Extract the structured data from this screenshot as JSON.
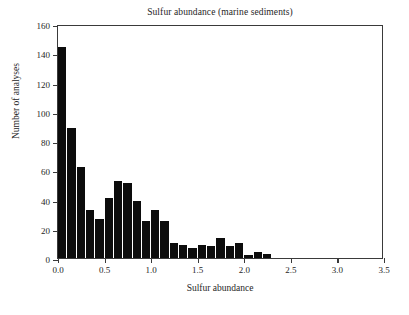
{
  "chart_data": {
    "type": "bar",
    "title": "Sulfur abundance (marine sediments)",
    "xlabel": "Sulfur abundance",
    "ylabel": "Number of analyses",
    "xlim": [
      0.0,
      3.5
    ],
    "ylim": [
      0,
      160
    ],
    "grid": false,
    "legend": null,
    "bin_width": 0.1,
    "xticks": [
      "0.0",
      "0.5",
      "1.0",
      "1.5",
      "2.0",
      "2.5",
      "3.0",
      "3.5"
    ],
    "xtick_values": [
      0.0,
      0.5,
      1.0,
      1.5,
      2.0,
      2.5,
      3.0,
      3.5
    ],
    "yticks": [
      "0",
      "20",
      "40",
      "60",
      "80",
      "100",
      "120",
      "140",
      "160"
    ],
    "ytick_values": [
      0,
      20,
      40,
      60,
      80,
      100,
      120,
      140,
      160
    ],
    "categories": [
      "0.0-0.1",
      "0.1-0.2",
      "0.2-0.3",
      "0.3-0.4",
      "0.4-0.5",
      "0.5-0.6",
      "0.6-0.7",
      "0.7-0.8",
      "0.8-0.9",
      "0.9-1.0",
      "1.0-1.1",
      "1.1-1.2",
      "1.2-1.3",
      "1.3-1.4",
      "1.4-1.5",
      "1.5-1.6",
      "1.6-1.7",
      "1.7-1.8",
      "1.8-1.9",
      "1.9-2.0",
      "2.0-2.1",
      "2.1-2.2",
      "2.2-2.3"
    ],
    "bin_starts": [
      0.0,
      0.1,
      0.2,
      0.3,
      0.4,
      0.5,
      0.6,
      0.7,
      0.8,
      0.9,
      1.0,
      1.1,
      1.2,
      1.3,
      1.4,
      1.5,
      1.6,
      1.7,
      1.8,
      1.9,
      2.0,
      2.1,
      2.2
    ],
    "values": [
      144,
      89,
      62,
      33,
      27,
      41,
      53,
      51,
      39,
      25,
      33,
      25,
      10,
      9,
      7,
      9,
      8,
      14,
      8,
      10,
      2,
      4,
      3
    ],
    "bar_color": "#0c0c0c",
    "axis_color": "#3a3a3a",
    "background_color": "#ffffff"
  }
}
